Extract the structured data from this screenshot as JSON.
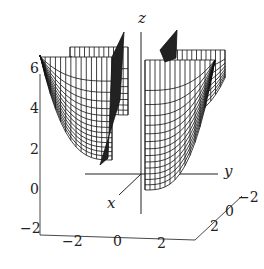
{
  "chart_data": {
    "type": "surface3d",
    "title": "",
    "style": "wireframe",
    "axes": {
      "x": {
        "label": "x",
        "ticks": [
          "-2",
          "0",
          "2"
        ]
      },
      "y": {
        "label": "y",
        "ticks": [
          "2",
          "0",
          "-2"
        ]
      },
      "z": {
        "label": "z",
        "ticks": [
          "-2",
          "0",
          "2",
          "4",
          "6"
        ],
        "range": [
          -2,
          6
        ]
      }
    },
    "colors": {
      "line": "#111111",
      "background": "#ffffff"
    }
  },
  "labels": {
    "z_ticks": [
      {
        "text": "6",
        "x": 30,
        "y": 68
      },
      {
        "text": "4",
        "x": 30,
        "y": 108
      },
      {
        "text": "2",
        "x": 30,
        "y": 149
      },
      {
        "text": "0",
        "x": 30,
        "y": 189
      },
      {
        "text": "−2",
        "x": 20,
        "y": 228
      }
    ],
    "x_ticks": [
      {
        "text": "−2",
        "x": 62,
        "y": 241
      },
      {
        "text": "0",
        "x": 113,
        "y": 241
      },
      {
        "text": "2",
        "x": 157,
        "y": 243
      }
    ],
    "y_ticks": [
      {
        "text": "2",
        "x": 210,
        "y": 226
      },
      {
        "text": "0",
        "x": 225,
        "y": 211
      },
      {
        "text": "−2",
        "x": 238,
        "y": 197
      }
    ],
    "axis_labels": {
      "x": {
        "text": "x",
        "x": 107,
        "y": 203
      },
      "y": {
        "text": "y",
        "x": 224,
        "y": 171
      },
      "z": {
        "text": "z",
        "x": 138,
        "y": 18
      }
    }
  }
}
